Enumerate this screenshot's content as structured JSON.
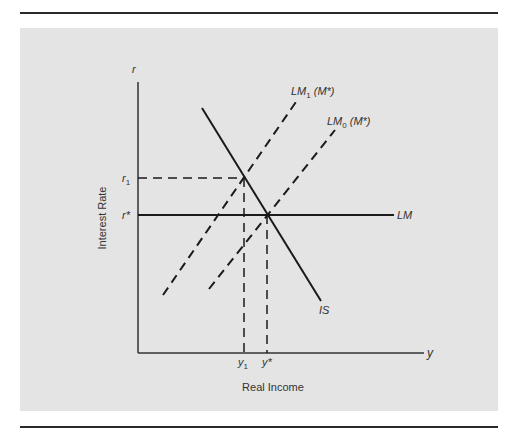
{
  "figure": {
    "y_axis_symbol": "r",
    "x_axis_symbol": "y",
    "y_axis_title": "Interest Rate",
    "x_axis_title": "Real Income",
    "y_ticks": {
      "r1_base": "r",
      "r1_sub": "1",
      "rstar": "r*"
    },
    "x_ticks": {
      "y1_base": "y",
      "y1_sub": "1",
      "ystar": "y*"
    },
    "curves": {
      "lm1_base": "LM",
      "lm1_sub": "1",
      "lm1_arg": "(M*)",
      "lm0_base": "LM",
      "lm0_sub": "0",
      "lm0_arg": "(M*)",
      "lm": "LM",
      "is": "IS"
    }
  },
  "colors": {
    "panel_bg": "#e4e4e4",
    "line": "#1a1a1a",
    "text": "#333333"
  }
}
